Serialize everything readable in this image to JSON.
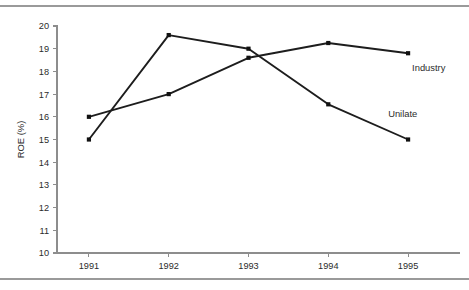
{
  "chart_data": {
    "type": "line",
    "title": "",
    "subtitle": "",
    "xlabel": "",
    "ylabel": "ROE (%)",
    "categories": [
      "1991",
      "1992",
      "1993",
      "1994",
      "1995"
    ],
    "x": [
      1991,
      1992,
      1993,
      1994,
      1995
    ],
    "xlim": [
      1990.6,
      1995.4
    ],
    "ylim": [
      10,
      20
    ],
    "ytick_labels": [
      "10",
      "11",
      "12",
      "13",
      "14",
      "15",
      "16",
      "17",
      "18",
      "19",
      "20"
    ],
    "ytick_values": [
      10,
      11,
      12,
      13,
      14,
      15,
      16,
      17,
      18,
      19,
      20
    ],
    "xtick_labels": [
      "1991",
      "1992",
      "1993",
      "1994",
      "1995"
    ],
    "grid": false,
    "legend_position": "inline-right",
    "series": [
      {
        "name": "Industry",
        "label": "Industry",
        "color": "#1d1d1d",
        "marker": "square",
        "values": [
          16.0,
          17.0,
          18.6,
          19.25,
          18.8
        ],
        "label_x": 1995.05,
        "label_y": 18.0
      },
      {
        "name": "Unilate",
        "label": "Unilate",
        "color": "#1d1d1d",
        "marker": "square",
        "values": [
          15.0,
          19.6,
          19.0,
          16.55,
          15.0
        ],
        "label_x": 1994.75,
        "label_y": 16.0
      }
    ],
    "annotations": []
  },
  "figure": {
    "axis_color": "#8d8d8d",
    "line_color": "#1d1d1d",
    "text_color": "#2b2b2b",
    "rule_color": "#9a9a9a",
    "background": "#ffffff"
  }
}
